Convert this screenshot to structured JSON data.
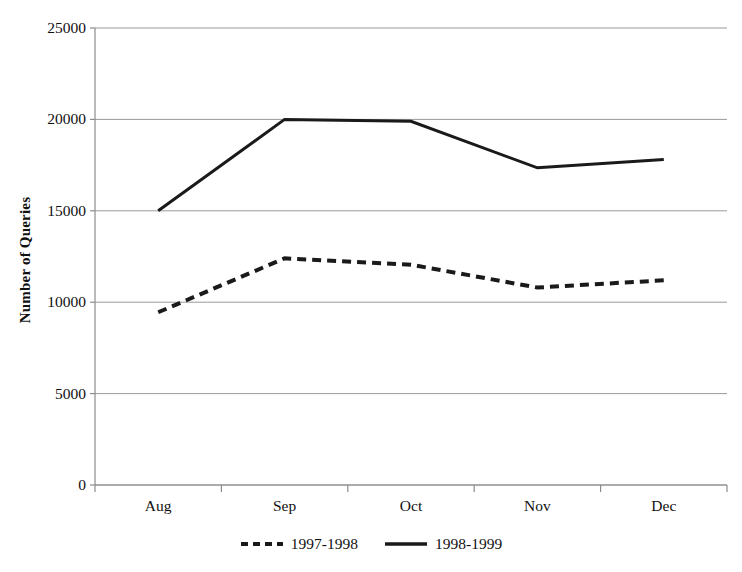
{
  "chart_data": {
    "type": "line",
    "title": "",
    "xlabel": "",
    "ylabel": "Number of Queries",
    "categories": [
      "Aug",
      "Sep",
      "Oct",
      "Nov",
      "Dec"
    ],
    "ylim": [
      0,
      25000
    ],
    "yticks": [
      0,
      5000,
      10000,
      15000,
      20000,
      25000
    ],
    "ytick_labels": [
      "0",
      "5000",
      "10000",
      "15000",
      "20000",
      "25000"
    ],
    "grid": true,
    "grid_axis": "y",
    "legend_position": "bottom",
    "series": [
      {
        "name": "1997-1998",
        "style": "dashed",
        "color": "#1a1a1a",
        "values": [
          9450,
          12400,
          12050,
          10800,
          11200
        ]
      },
      {
        "name": "1998-1999",
        "style": "solid",
        "color": "#1a1a1a",
        "values": [
          15000,
          20000,
          19900,
          17350,
          17800
        ]
      }
    ]
  },
  "axis": {
    "y_title": "Number of Queries"
  },
  "legend": {
    "entries": [
      {
        "label": "1997-1998",
        "style": "dashed"
      },
      {
        "label": "1998-1999",
        "style": "solid"
      }
    ]
  },
  "colors": {
    "line": "#1a1a1a",
    "grid": "#9a9a9a",
    "axis": "#8c8c8c",
    "text": "#111111",
    "background": "#ffffff"
  }
}
